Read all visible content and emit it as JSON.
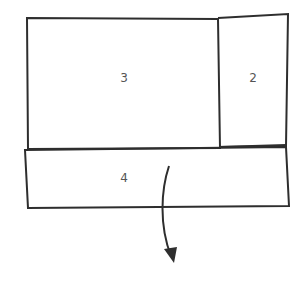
{
  "diagram": {
    "colors": {
      "stroke": "#2e2e2e",
      "label": "#555555",
      "background": "#ffffff"
    },
    "panels": [
      {
        "id": "panel-3",
        "label": "3"
      },
      {
        "id": "panel-2",
        "label": "2"
      },
      {
        "id": "panel-4",
        "label": "4"
      }
    ],
    "arrow": {
      "direction": "down",
      "meaning": "fold-down"
    }
  }
}
